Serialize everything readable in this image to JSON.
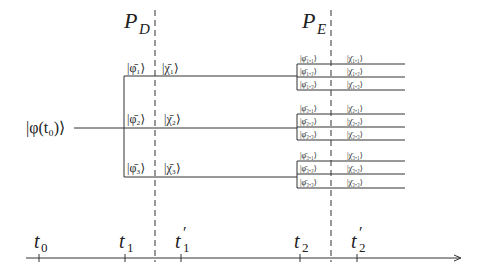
{
  "diagram": {
    "projectors": {
      "pd": {
        "label": "P",
        "sub": "D",
        "x": 155
      },
      "pe": {
        "label": "P",
        "sub": "E",
        "x": 331
      }
    },
    "initial_state": {
      "label": "|φ(t₀)⟩"
    },
    "first_branches": [
      {
        "phi": "|φ̄₁⟩",
        "chi": "|χ̄₁⟩",
        "y": 76
      },
      {
        "phi": "|φ̄₂⟩",
        "chi": "|χ̄₂⟩",
        "y": 128
      },
      {
        "phi": "|φ̄₃⟩",
        "chi": "|χ̄₃⟩",
        "y": 177
      }
    ],
    "second_branches": [
      {
        "group": 1,
        "items": [
          {
            "phi": "|φ̄₁,₁⟩",
            "chi": "|χ̄₁,₁⟩"
          },
          {
            "phi": "|φ̄₁,₂⟩",
            "chi": "|χ̄₁,₂⟩"
          },
          {
            "phi": "|φ̄₁,₃⟩",
            "chi": "|χ̄₁,₃⟩"
          }
        ]
      },
      {
        "group": 2,
        "items": [
          {
            "phi": "|φ̄₂,₁⟩",
            "chi": "|χ̄₂,₁⟩"
          },
          {
            "phi": "|φ̄₂,₂⟩",
            "chi": "|χ̄₂,₂⟩"
          },
          {
            "phi": "|φ̄₂,₃⟩",
            "chi": "|χ̄₂,₃⟩"
          }
        ]
      },
      {
        "group": 3,
        "items": [
          {
            "phi": "|φ̄₃,₁⟩",
            "chi": "|χ̄₃,₁⟩"
          },
          {
            "phi": "|φ̄₃,₂⟩",
            "chi": "|χ̄₃,₂⟩"
          },
          {
            "phi": "|φ̄₃,₃⟩",
            "chi": "|χ̄₃,₃⟩"
          }
        ]
      }
    ],
    "time_axis": {
      "ticks": [
        {
          "label": "t",
          "sub": "0",
          "prime": "",
          "x": 39
        },
        {
          "label": "t",
          "sub": "1",
          "prime": "",
          "x": 125
        },
        {
          "label": "t",
          "sub": "1",
          "prime": "′",
          "x": 181
        },
        {
          "label": "t",
          "sub": "2",
          "prime": "",
          "x": 300
        },
        {
          "label": "t",
          "sub": "2",
          "prime": "′",
          "x": 357
        }
      ]
    }
  }
}
